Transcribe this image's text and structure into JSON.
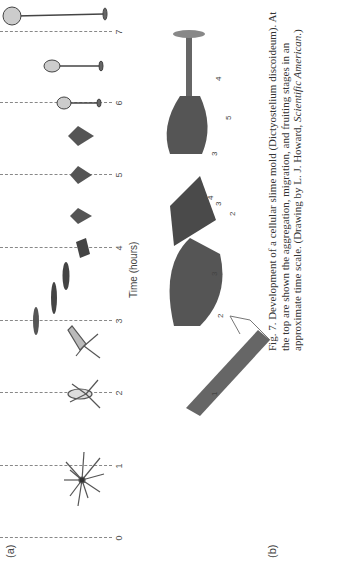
{
  "figure": {
    "orientation": "rotated 90 degrees counter-clockwise",
    "panel_a": {
      "label": "(a)",
      "axis_label": "Time (hours)",
      "ticks": [
        "0",
        "1",
        "2",
        "3",
        "4",
        "5",
        "6",
        "7"
      ],
      "stages": [
        "aggregation",
        "migration",
        "fruiting"
      ]
    },
    "panel_b": {
      "label": "(b)",
      "drawings": [
        {
          "name": "aggregate-with-tip",
          "part_labels": [
            "1"
          ]
        },
        {
          "name": "migrating-slug",
          "part_labels": [
            "2",
            "3"
          ]
        },
        {
          "name": "culminating-mound",
          "part_labels": [
            "2",
            "3",
            "4"
          ]
        },
        {
          "name": "fruiting-body-forming",
          "part_labels": [
            "3",
            "4",
            "5"
          ]
        }
      ]
    },
    "caption": {
      "prefix": "Fig. 7. Development of a cellular slime mold (Dictyostelium discoideum). At the top are shown the aggregation, migration, and fruiting stages in an approximate time scale. (Drawing by L. J. Howard, ",
      "italic": "Scientific American",
      "suffix": ".)"
    }
  }
}
